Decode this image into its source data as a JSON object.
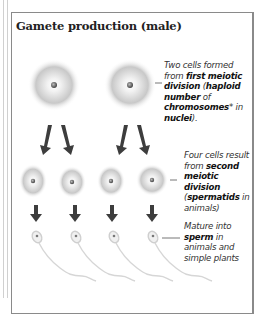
{
  "title": "Gamete production (male)",
  "stages": [
    {
      "name": "first-division",
      "cells": 2,
      "note_parts": [
        {
          "text": "Two cells formed from ",
          "bold": false
        },
        {
          "text": "first meiotic division",
          "bold": true
        },
        {
          "text": " (",
          "bold": false
        },
        {
          "text": "haploid number",
          "bold": true
        },
        {
          "text": " of ",
          "bold": false
        },
        {
          "text": "chromosomes",
          "bold": true
        },
        {
          "text": "* in ",
          "bold": false
        },
        {
          "text": "nuclei",
          "bold": true
        },
        {
          "text": ").",
          "bold": false
        }
      ]
    },
    {
      "name": "second-division",
      "cells": 4,
      "note_parts": [
        {
          "text": "Four cells result from ",
          "bold": false
        },
        {
          "text": "second meiotic division",
          "bold": true
        },
        {
          "text": " (",
          "bold": false
        },
        {
          "text": "spermatids",
          "bold": true
        },
        {
          "text": " in animals)",
          "bold": false
        }
      ]
    },
    {
      "name": "maturation",
      "cells": 4,
      "note_parts": [
        {
          "text": "Mature into ",
          "bold": false
        },
        {
          "text": "sperm",
          "bold": true
        },
        {
          "text": " in animals and simple plants",
          "bold": false
        }
      ]
    }
  ],
  "colors": {
    "arrow": "#3d3d3d",
    "cell_halo": "#bdbdbd",
    "nucleus": "#555555",
    "frame": "#8a8a8a"
  }
}
